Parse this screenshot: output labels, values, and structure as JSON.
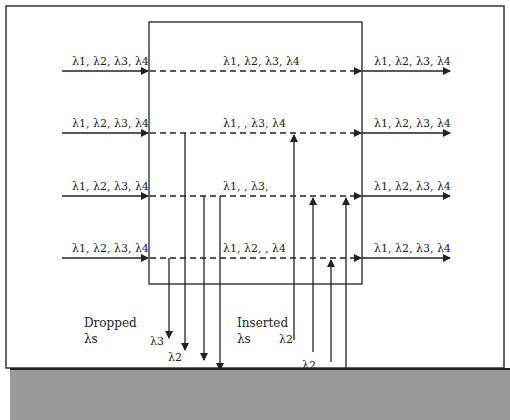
{
  "diagram": {
    "input_labels": [
      "λ1, λ2, λ3, λ4",
      "λ1, λ2, λ3, λ4",
      "λ1, λ2, λ3, λ4",
      "λ1, λ2, λ3, λ4"
    ],
    "through_labels": [
      "λ1, λ2, λ3, λ4",
      "λ1,   , λ3, λ4",
      "λ1,   , λ3,",
      "λ1, λ2,   , λ4"
    ],
    "output_labels": [
      "λ1, λ2, λ3, λ4",
      "λ1, λ2, λ3, λ4",
      "λ1, λ2, λ3, λ4",
      "λ1, λ2, λ3, λ4"
    ],
    "dropped_caption": [
      "Dropped",
      "λs"
    ],
    "inserted_caption": [
      "Inserted",
      "λs"
    ],
    "dropped_labels": [
      "λ3",
      "λ2",
      "λ2",
      "λ4"
    ],
    "inserted_labels": [
      "λ2",
      "λ2",
      "λ3",
      "λ4"
    ],
    "colors": {
      "line": "#222222",
      "footer": "#9a9a9a"
    }
  }
}
